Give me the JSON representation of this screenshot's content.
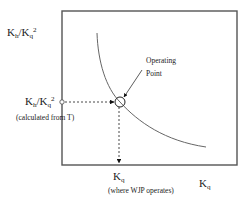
{
  "diagram": {
    "y_axis_label": {
      "base1": "K",
      "sub1": "h",
      "sep": "/K",
      "sub2": "q",
      "sup": "2"
    },
    "y_marker_label": {
      "base1": "K",
      "sub1": "h",
      "sep": "/K",
      "sub2": "q",
      "sup": "2"
    },
    "y_marker_note": "(calculated from T)",
    "operating_point_line1": "Operating",
    "operating_point_line2": "Point",
    "x_marker_label": {
      "base": "K",
      "sub": "q"
    },
    "x_marker_note": "(where WJP operates)",
    "x_axis_label": {
      "base": "K",
      "sub": "q"
    }
  },
  "colors": {
    "axis": "#555555",
    "curve": "#666666",
    "text": "#222222",
    "background": "#ffffff"
  }
}
